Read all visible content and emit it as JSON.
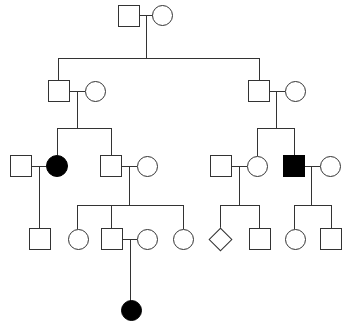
{
  "diagram": {
    "type": "pedigree",
    "width": 342,
    "height": 330,
    "legend": {
      "male_symbol": "square",
      "female_symbol": "circle",
      "unknown_sex_symbol": "diamond",
      "affected_fill": "#000000",
      "unaffected_fill": "#ffffff",
      "line_color": "#333333"
    },
    "generation_count": 5,
    "affected_count": 3,
    "individual_count": 25,
    "individuals": [
      {
        "id": "I-1",
        "generation": 1,
        "sex": "male",
        "affected": false,
        "x": 118,
        "y": 5,
        "size": 22
      },
      {
        "id": "I-2",
        "generation": 1,
        "sex": "female",
        "affected": false,
        "x": 152,
        "y": 5,
        "size": 21
      },
      {
        "id": "II-1",
        "generation": 2,
        "sex": "male",
        "affected": false,
        "x": 48,
        "y": 80,
        "size": 22
      },
      {
        "id": "II-2",
        "generation": 2,
        "sex": "female",
        "affected": false,
        "x": 85,
        "y": 81,
        "size": 21
      },
      {
        "id": "II-3",
        "generation": 2,
        "sex": "male",
        "affected": false,
        "x": 248,
        "y": 80,
        "size": 22
      },
      {
        "id": "II-4",
        "generation": 2,
        "sex": "female",
        "affected": false,
        "x": 285,
        "y": 81,
        "size": 21
      },
      {
        "id": "III-1",
        "generation": 3,
        "sex": "male",
        "affected": false,
        "x": 10,
        "y": 155,
        "size": 22
      },
      {
        "id": "III-2",
        "generation": 3,
        "sex": "female",
        "affected": true,
        "x": 46,
        "y": 155,
        "size": 22
      },
      {
        "id": "III-3",
        "generation": 3,
        "sex": "male",
        "affected": false,
        "x": 100,
        "y": 155,
        "size": 22
      },
      {
        "id": "III-4",
        "generation": 3,
        "sex": "female",
        "affected": false,
        "x": 137,
        "y": 156,
        "size": 21
      },
      {
        "id": "III-5",
        "generation": 3,
        "sex": "male",
        "affected": false,
        "x": 210,
        "y": 155,
        "size": 22
      },
      {
        "id": "III-6",
        "generation": 3,
        "sex": "female",
        "affected": false,
        "x": 247,
        "y": 156,
        "size": 21
      },
      {
        "id": "III-7",
        "generation": 3,
        "sex": "male",
        "affected": true,
        "x": 283,
        "y": 155,
        "size": 22
      },
      {
        "id": "III-8",
        "generation": 3,
        "sex": "female",
        "affected": false,
        "x": 320,
        "y": 156,
        "size": 21
      },
      {
        "id": "IV-1",
        "generation": 4,
        "sex": "male",
        "affected": false,
        "x": 29,
        "y": 228,
        "size": 22
      },
      {
        "id": "IV-2",
        "generation": 4,
        "sex": "female",
        "affected": false,
        "x": 68,
        "y": 229,
        "size": 21
      },
      {
        "id": "IV-3",
        "generation": 4,
        "sex": "male",
        "affected": false,
        "x": 101,
        "y": 228,
        "size": 22
      },
      {
        "id": "IV-4",
        "generation": 4,
        "sex": "female",
        "affected": false,
        "x": 137,
        "y": 229,
        "size": 21
      },
      {
        "id": "IV-5",
        "generation": 4,
        "sex": "female",
        "affected": false,
        "x": 173,
        "y": 229,
        "size": 21
      },
      {
        "id": "IV-6",
        "generation": 4,
        "sex": "unknown",
        "affected": false,
        "x": 212,
        "y": 231,
        "size": 17
      },
      {
        "id": "IV-7",
        "generation": 4,
        "sex": "male",
        "affected": false,
        "x": 249,
        "y": 228,
        "size": 22
      },
      {
        "id": "IV-8",
        "generation": 4,
        "sex": "female",
        "affected": false,
        "x": 285,
        "y": 229,
        "size": 21
      },
      {
        "id": "IV-9",
        "generation": 4,
        "sex": "male",
        "affected": false,
        "x": 320,
        "y": 228,
        "size": 22
      },
      {
        "id": "V-1",
        "generation": 5,
        "sex": "female",
        "affected": true,
        "x": 121,
        "y": 300,
        "size": 21
      }
    ],
    "connectors": [
      {
        "id": "mate-I",
        "kind": "mating-line",
        "orient": "h",
        "x": 140,
        "y": 15,
        "len": 13
      },
      {
        "id": "descent-I",
        "kind": "descent-line",
        "orient": "v",
        "x": 146,
        "y": 15,
        "len": 43
      },
      {
        "id": "sib-I",
        "kind": "sibship-line",
        "orient": "h",
        "x": 58,
        "y": 58,
        "len": 202
      },
      {
        "id": "drop-II-1",
        "kind": "drop-line",
        "orient": "v",
        "x": 58,
        "y": 58,
        "len": 22
      },
      {
        "id": "drop-II-3",
        "kind": "drop-line",
        "orient": "v",
        "x": 259,
        "y": 58,
        "len": 22
      },
      {
        "id": "mate-II-L",
        "kind": "mating-line",
        "orient": "h",
        "x": 70,
        "y": 91,
        "len": 15
      },
      {
        "id": "descent-II-L",
        "kind": "descent-line",
        "orient": "v",
        "x": 77,
        "y": 91,
        "len": 37
      },
      {
        "id": "sib-II-L",
        "kind": "sibship-line",
        "orient": "h",
        "x": 57,
        "y": 128,
        "len": 54
      },
      {
        "id": "drop-III-2",
        "kind": "drop-line",
        "orient": "v",
        "x": 57,
        "y": 128,
        "len": 27
      },
      {
        "id": "drop-III-3",
        "kind": "drop-line",
        "orient": "v",
        "x": 111,
        "y": 128,
        "len": 27
      },
      {
        "id": "mate-II-R",
        "kind": "mating-line",
        "orient": "h",
        "x": 270,
        "y": 91,
        "len": 15
      },
      {
        "id": "descent-II-R",
        "kind": "descent-line",
        "orient": "v",
        "x": 276,
        "y": 91,
        "len": 37
      },
      {
        "id": "sib-II-R",
        "kind": "sibship-line",
        "orient": "h",
        "x": 257,
        "y": 128,
        "len": 37
      },
      {
        "id": "drop-III-6",
        "kind": "drop-line",
        "orient": "v",
        "x": 257,
        "y": 128,
        "len": 28
      },
      {
        "id": "drop-III-7",
        "kind": "drop-line",
        "orient": "v",
        "x": 294,
        "y": 128,
        "len": 27
      },
      {
        "id": "mate-III-1",
        "kind": "mating-line",
        "orient": "h",
        "x": 32,
        "y": 166,
        "len": 14
      },
      {
        "id": "descent-III-1",
        "kind": "descent-line",
        "orient": "v",
        "x": 39,
        "y": 166,
        "len": 62
      },
      {
        "id": "mate-III-3",
        "kind": "mating-line",
        "orient": "h",
        "x": 122,
        "y": 166,
        "len": 15
      },
      {
        "id": "descent-III-3",
        "kind": "descent-line",
        "orient": "v",
        "x": 129,
        "y": 166,
        "len": 39
      },
      {
        "id": "sib-III-L",
        "kind": "sibship-line",
        "orient": "h",
        "x": 77,
        "y": 205,
        "len": 106
      },
      {
        "id": "drop-IV-2",
        "kind": "drop-line",
        "orient": "v",
        "x": 77,
        "y": 205,
        "len": 24
      },
      {
        "id": "drop-IV-3",
        "kind": "drop-line",
        "orient": "v",
        "x": 111,
        "y": 205,
        "len": 23
      },
      {
        "id": "drop-IV-5",
        "kind": "drop-line",
        "orient": "v",
        "x": 183,
        "y": 205,
        "len": 24
      },
      {
        "id": "mate-III-5",
        "kind": "mating-line",
        "orient": "h",
        "x": 232,
        "y": 166,
        "len": 15
      },
      {
        "id": "descent-III-5",
        "kind": "descent-line",
        "orient": "v",
        "x": 239,
        "y": 166,
        "len": 39
      },
      {
        "id": "sib-III-R1",
        "kind": "sibship-line",
        "orient": "h",
        "x": 220,
        "y": 205,
        "len": 39
      },
      {
        "id": "drop-IV-6",
        "kind": "drop-line",
        "orient": "v",
        "x": 220,
        "y": 205,
        "len": 26
      },
      {
        "id": "drop-IV-7",
        "kind": "drop-line",
        "orient": "v",
        "x": 259,
        "y": 205,
        "len": 23
      },
      {
        "id": "mate-III-7",
        "kind": "mating-line",
        "orient": "h",
        "x": 305,
        "y": 166,
        "len": 15
      },
      {
        "id": "descent-III-7",
        "kind": "descent-line",
        "orient": "v",
        "x": 311,
        "y": 166,
        "len": 39
      },
      {
        "id": "sib-III-R2",
        "kind": "sibship-line",
        "orient": "h",
        "x": 294,
        "y": 205,
        "len": 37
      },
      {
        "id": "drop-IV-8",
        "kind": "drop-line",
        "orient": "v",
        "x": 294,
        "y": 205,
        "len": 24
      },
      {
        "id": "drop-IV-9",
        "kind": "drop-line",
        "orient": "v",
        "x": 331,
        "y": 205,
        "len": 23
      },
      {
        "id": "mate-IV-3",
        "kind": "mating-line",
        "orient": "h",
        "x": 123,
        "y": 239,
        "len": 14
      },
      {
        "id": "descent-IV-3",
        "kind": "descent-line",
        "orient": "v",
        "x": 130,
        "y": 239,
        "len": 62
      }
    ]
  }
}
